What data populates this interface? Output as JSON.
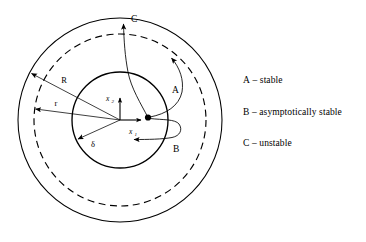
{
  "figure": {
    "background_color": "#ffffff",
    "stroke_color": "#000000"
  },
  "geometry": {
    "center_x": 120,
    "center_y": 120,
    "outer_circle_radius": 102,
    "dashed_circle_radius": 86,
    "inner_circle_radius": 48
  },
  "axes": {
    "horizontal": {
      "label": "x",
      "subscript": "1"
    },
    "vertical": {
      "label": "x",
      "subscript": "2"
    }
  },
  "radii_labels": {
    "outer": "R",
    "middle": "r",
    "inner": "δ"
  },
  "trajectories": [
    {
      "id": "A",
      "label": "A",
      "meaning": "stable"
    },
    {
      "id": "B",
      "label": "B",
      "meaning": "asymptotically stable"
    },
    {
      "id": "C",
      "label": "C",
      "meaning": "unstable"
    }
  ],
  "legend": {
    "dash": "–",
    "items": [
      {
        "key": "A",
        "dash": "–",
        "description": "stable"
      },
      {
        "key": "B",
        "dash": "–",
        "description": "asymptotically stable"
      },
      {
        "key": "C",
        "dash": "–",
        "description": "unstable"
      }
    ]
  }
}
